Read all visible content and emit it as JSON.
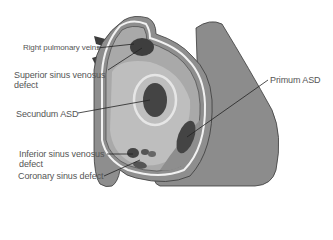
{
  "diagram": {
    "colors": {
      "outer_wall": "#8a8a8a",
      "atrium_fill": "#a6a6a6",
      "septum_fill": "#bdbdbd",
      "defect": "#4a4a4a",
      "vein": "#3c3c3c",
      "outline": "#3a3a3a",
      "leader_line": "#222222",
      "label_text": "#555555"
    },
    "labels": [
      {
        "id": "right-pulmonary-veins",
        "text": "Right pulmonary veins"
      },
      {
        "id": "superior-sinus-venosus-defect",
        "line1": "Superior sinus venosus",
        "line2": "defect"
      },
      {
        "id": "secundum-asd",
        "text": "Secundum ASD"
      },
      {
        "id": "inferior-sinus-venosus-defect",
        "line1": "Inferior sinus venosus",
        "line2": "defect"
      },
      {
        "id": "coronary-sinus-defect",
        "text": "Coronary sinus defect"
      },
      {
        "id": "primum-asd",
        "text": "Primum ASD"
      }
    ]
  }
}
